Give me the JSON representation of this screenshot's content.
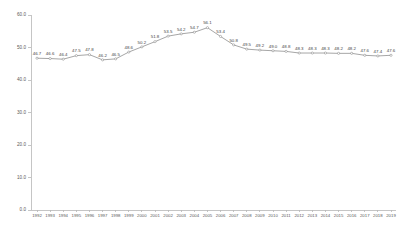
{
  "chart_data": {
    "type": "line",
    "title": "",
    "subtitle": "",
    "xlabel": "",
    "ylabel": "",
    "ylim": [
      0,
      60
    ],
    "yticks": [
      0,
      10,
      20,
      30,
      40,
      50,
      60
    ],
    "ytick_labels": [
      "0.0",
      "10.0",
      "20.0",
      "30.0",
      "40.0",
      "50.0",
      "60.0"
    ],
    "grid": false,
    "legend": false,
    "legend_position": "none",
    "show_point_labels": true,
    "line_color": "#808080",
    "marker_color": "#ffffff",
    "axis_color": "#b7b7b7",
    "label_color": "#3f3f3f",
    "categories": [
      "1992",
      "1993",
      "1994",
      "1995",
      "1996",
      "1997",
      "1998",
      "1999",
      "2000",
      "2001",
      "2002",
      "2003",
      "2004",
      "2005",
      "2006",
      "2007",
      "2008",
      "2009",
      "2010",
      "2011",
      "2012",
      "2013",
      "2014",
      "2015",
      "2016",
      "2017",
      "2018",
      "2019"
    ],
    "values": [
      46.7,
      46.6,
      46.4,
      47.5,
      47.8,
      46.2,
      46.5,
      48.6,
      50.2,
      51.8,
      53.5,
      54.2,
      54.7,
      56.1,
      53.4,
      50.8,
      49.5,
      49.2,
      49.0,
      48.8,
      48.3,
      48.3,
      48.3,
      48.2,
      48.2,
      47.6,
      47.4,
      47.6
    ],
    "point_labels": [
      "46.7",
      "46.6",
      "46.4",
      "47.5",
      "47.8",
      "46.2",
      "46.5",
      "48.6",
      "50.2",
      "51.8",
      "53.5",
      "54.2",
      "54.7",
      "56.1",
      "53.4",
      "50.8",
      "49.5",
      "49.2",
      "49.0",
      "48.8",
      "48.3",
      "48.3",
      "48.3",
      "48.2",
      "48.2",
      "47.6",
      "47.4",
      "47.6"
    ]
  }
}
